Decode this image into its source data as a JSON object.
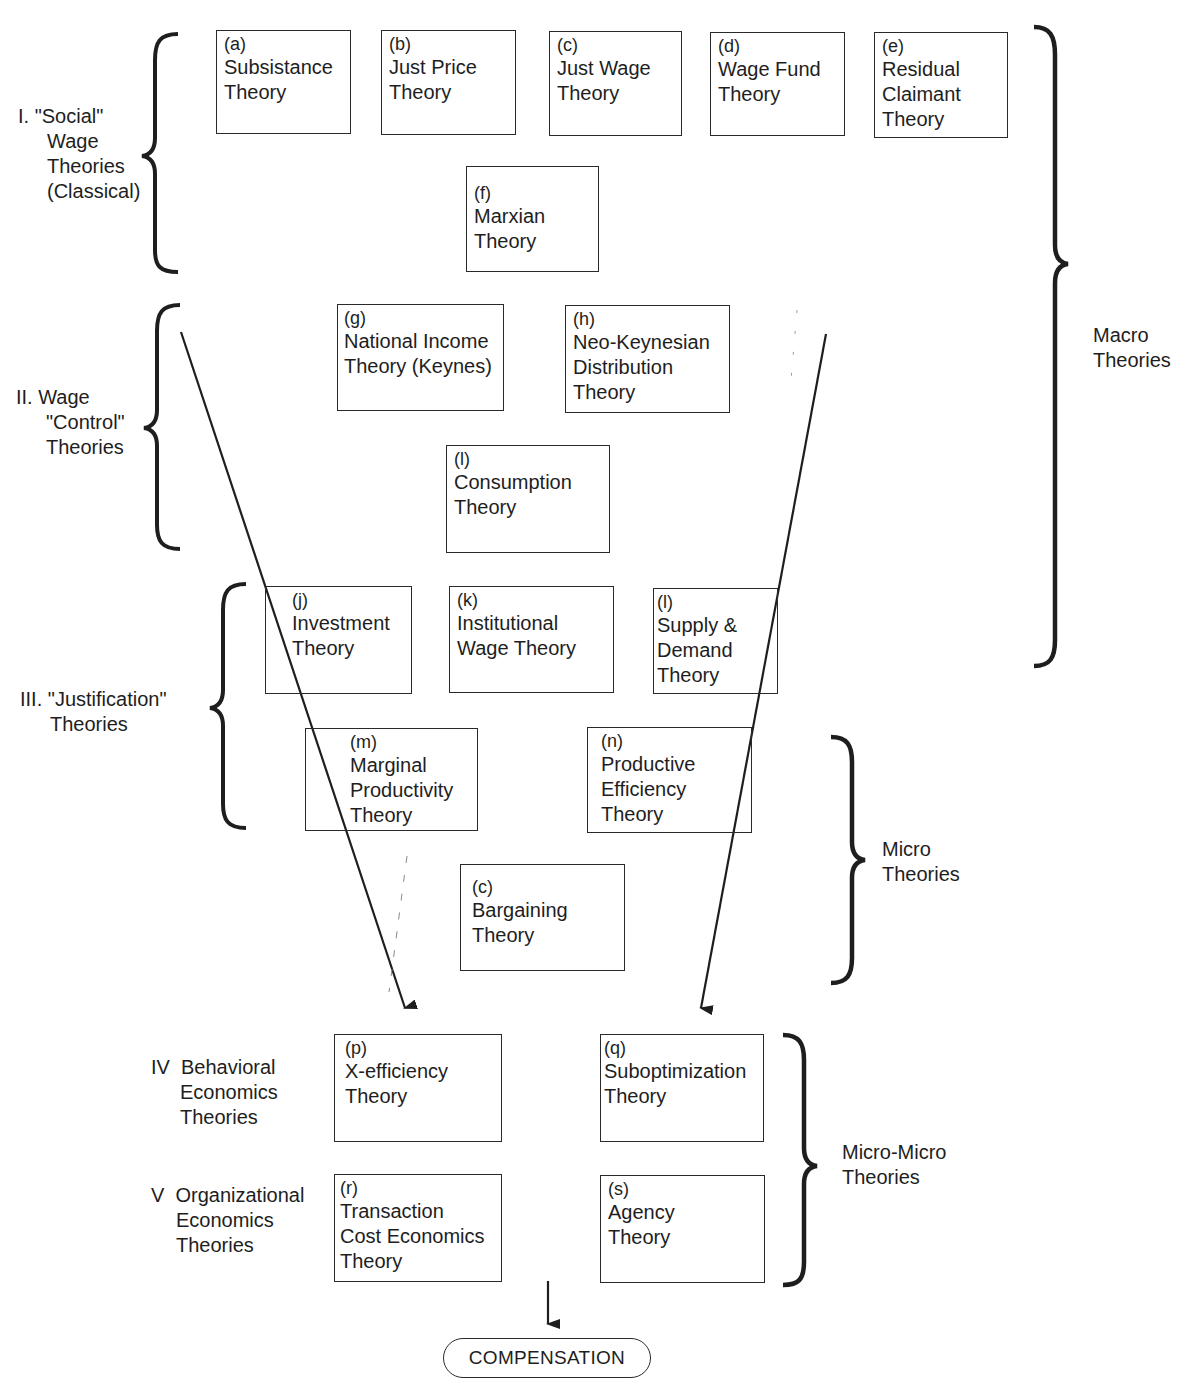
{
  "diagram": {
    "categories": [
      {
        "id": "I",
        "lines": [
          "I. \"Social\"",
          "Wage",
          "Theories",
          "(Classical)"
        ]
      },
      {
        "id": "II",
        "lines": [
          "II. Wage",
          "\"Control\"",
          "Theories"
        ]
      },
      {
        "id": "III",
        "lines": [
          "III. \"Justification\"",
          "Theories"
        ]
      },
      {
        "id": "IV",
        "lines": [
          "IV  Behavioral",
          "Economics",
          "Theories"
        ]
      },
      {
        "id": "V",
        "lines": [
          "V  Organizational",
          "Economics",
          "Theories"
        ]
      }
    ],
    "scopes": [
      {
        "id": "macro",
        "lines": [
          "Macro",
          "Theories"
        ]
      },
      {
        "id": "micro",
        "lines": [
          "Micro",
          "Theories"
        ]
      },
      {
        "id": "micro_micro",
        "lines": [
          "Micro-Micro",
          "Theories"
        ]
      }
    ],
    "boxes": [
      {
        "tag": "(a)",
        "lines": [
          "Subsistance",
          "Theory"
        ]
      },
      {
        "tag": "(b)",
        "lines": [
          "Just Price",
          "Theory"
        ]
      },
      {
        "tag": "(c)",
        "lines": [
          "Just Wage",
          "Theory"
        ]
      },
      {
        "tag": "(d)",
        "lines": [
          "Wage Fund",
          "Theory"
        ]
      },
      {
        "tag": "(e)",
        "lines": [
          "Residual",
          "Claimant",
          "Theory"
        ]
      },
      {
        "tag": "(f)",
        "lines": [
          "Marxian",
          "Theory"
        ]
      },
      {
        "tag": "(g)",
        "lines": [
          "National Income",
          "Theory (Keynes)"
        ]
      },
      {
        "tag": "(h)",
        "lines": [
          "Neo-Keynesian",
          "Distribution",
          "Theory"
        ]
      },
      {
        "tag": "(l)",
        "lines": [
          "Consumption",
          "Theory"
        ]
      },
      {
        "tag": "(j)",
        "lines": [
          "Investment",
          "Theory"
        ]
      },
      {
        "tag": "(k)",
        "lines": [
          "Institutional",
          "Wage Theory"
        ]
      },
      {
        "tag": "(l)",
        "lines": [
          "Supply &",
          "Demand",
          "Theory"
        ]
      },
      {
        "tag": "(m)",
        "lines": [
          "Marginal",
          "Productivity",
          "Theory"
        ]
      },
      {
        "tag": "(n)",
        "lines": [
          "Productive",
          "Efficiency",
          "Theory"
        ]
      },
      {
        "tag": "(c)",
        "lines": [
          "Bargaining",
          "Theory"
        ]
      },
      {
        "tag": "(p)",
        "lines": [
          "X-efficiency",
          "Theory"
        ]
      },
      {
        "tag": "(q)",
        "lines": [
          "Suboptimization",
          "Theory"
        ]
      },
      {
        "tag": "(r)",
        "lines": [
          "Transaction",
          "Cost Economics",
          "Theory"
        ]
      },
      {
        "tag": "(s)",
        "lines": [
          "Agency",
          "Theory"
        ]
      }
    ],
    "output": {
      "label": "COMPENSATION"
    },
    "colors": {
      "ink": "#1e1e1e",
      "border": "#2a2a2a",
      "background": "#ffffff"
    }
  }
}
